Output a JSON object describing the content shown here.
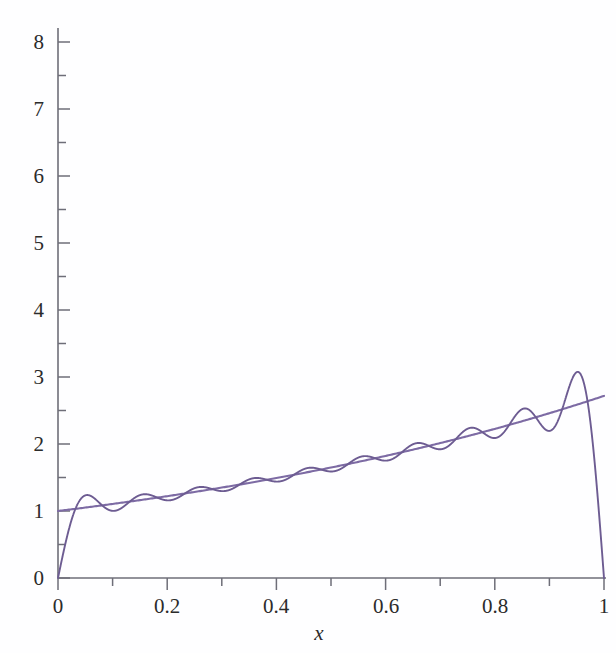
{
  "figure": {
    "background_color": "#fefeff",
    "width": 616,
    "height": 653
  },
  "axes": {
    "x_title": "x",
    "y_title": "",
    "x_tick_labels": [
      "0",
      "0.2",
      "0.4",
      "0.6",
      "0.8",
      "1"
    ],
    "y_tick_labels": [
      "0",
      "1",
      "2",
      "3",
      "4",
      "5",
      "6",
      "7",
      "8"
    ],
    "axis_color": "#6e6e78",
    "tick_text_color": "#2b2b2b"
  },
  "chart_data": {
    "type": "line",
    "title": "",
    "xlabel": "x",
    "ylabel": "",
    "xlim": [
      0,
      1
    ],
    "ylim": [
      0,
      8.55
    ],
    "grid": false,
    "legend": "none",
    "x_ticks": [
      0,
      0.2,
      0.4,
      0.6,
      0.8,
      1
    ],
    "x_minor_ticks": [
      0.1,
      0.3,
      0.5,
      0.7,
      0.9
    ],
    "y_ticks": [
      0,
      1,
      2,
      3,
      4,
      5,
      6,
      7,
      8
    ],
    "y_minor_ticks": [
      0.5,
      1.5,
      2.5,
      3.5,
      4.5,
      5.5,
      6.5,
      7.5
    ],
    "series": [
      {
        "name": "exp(x)",
        "kind": "smooth-target",
        "color": "#7d6ba4",
        "line_width": 2.1,
        "formula": "exp(x)",
        "x": [
          0,
          0.05,
          0.1,
          0.15,
          0.2,
          0.25,
          0.3,
          0.35,
          0.4,
          0.45,
          0.5,
          0.55,
          0.6,
          0.65,
          0.7,
          0.75,
          0.8,
          0.85,
          0.9,
          0.95,
          1
        ],
        "values": [
          1.0,
          1.051,
          1.105,
          1.162,
          1.221,
          1.284,
          1.35,
          1.419,
          1.492,
          1.568,
          1.649,
          1.733,
          1.822,
          1.916,
          2.014,
          2.117,
          2.226,
          2.34,
          2.46,
          2.586,
          2.718
        ]
      },
      {
        "name": "Fourier sine partial sum of exp(x), N = 20",
        "kind": "partial-sum",
        "color": "#6d5c92",
        "line_width": 1.9,
        "formula": "sum_{n=1..20} b_n sin(n*pi*x),  b_n = 2*n*pi*(1-(-1)^n*e)/(n^2*pi^2+1)",
        "terms": 20,
        "endpoint_value_at_0": 0,
        "endpoint_value_at_1": 0,
        "gibbs_overshoot_peak": 8.32,
        "gibbs_peak_x": 0.975,
        "notes": "Vertical drop to 0 at both x=0 and x=1; oscillation amplitude grows near x=1"
      }
    ],
    "annotations": []
  }
}
